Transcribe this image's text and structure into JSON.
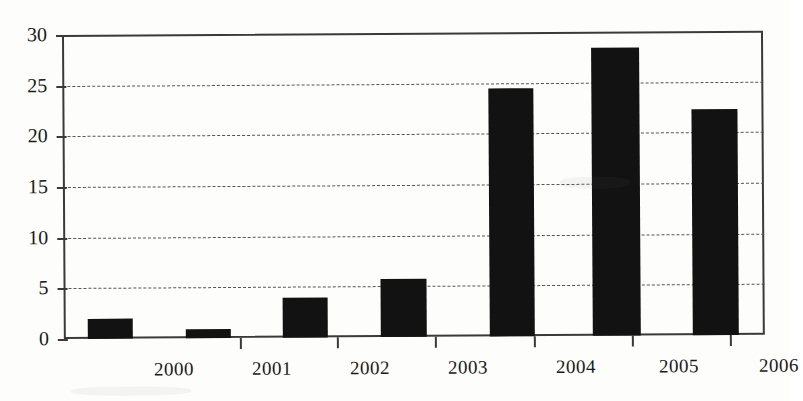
{
  "chart_data": {
    "type": "bar",
    "title": "",
    "subtitle": "",
    "xlabel": "",
    "ylabel": "",
    "categories": [
      "2000",
      "2001",
      "2002",
      "2003",
      "2004",
      "2005",
      "2006"
    ],
    "values": [
      2.0,
      0.9,
      3.9,
      5.7,
      24.5,
      28.4,
      22.3
    ],
    "series": [
      {
        "name": "",
        "values": [
          2.0,
          0.9,
          3.9,
          5.7,
          24.5,
          28.4,
          22.3
        ]
      }
    ],
    "ylim": [
      0,
      30
    ],
    "yticks": [
      0,
      5,
      10,
      15,
      20,
      25,
      30
    ],
    "ytick_labels": [
      "0",
      "5",
      "10",
      "15",
      "20",
      "25",
      "30"
    ],
    "xtick_labels": [
      "2000",
      "2001",
      "2002",
      "2003",
      "2004",
      "2005",
      "2006"
    ],
    "grid": true,
    "grid_axis": "y",
    "grid_style": "dashed",
    "legend": false,
    "legend_position": "none",
    "bar_color": "#121212",
    "axis_color": "#3a3a3a",
    "grid_color": "#555555",
    "background_color": "#fdfdfb"
  },
  "bars": [
    {
      "label": "2000",
      "value": 2.0,
      "left_px": 24,
      "width_px": 45
    },
    {
      "label": "2001",
      "value": 0.9,
      "left_px": 122,
      "width_px": 45
    },
    {
      "label": "2002",
      "value": 3.9,
      "left_px": 219,
      "width_px": 45
    },
    {
      "label": "2003",
      "value": 5.7,
      "left_px": 317,
      "width_px": 46
    },
    {
      "label": "2004",
      "value": 24.5,
      "left_px": 426,
      "width_px": 45
    },
    {
      "label": "2005",
      "value": 28.4,
      "left_px": 529,
      "width_px": 48
    },
    {
      "label": "2006",
      "value": 22.3,
      "left_px": 629,
      "width_px": 46
    }
  ],
  "yaxis": {
    "ticks": [
      {
        "label": "30",
        "value": 30
      },
      {
        "label": "25",
        "value": 25
      },
      {
        "label": "20",
        "value": 20
      },
      {
        "label": "15",
        "value": 15
      },
      {
        "label": "10",
        "value": 10
      },
      {
        "label": "5",
        "value": 5
      },
      {
        "label": "0",
        "value": 0
      }
    ]
  },
  "xaxis": {
    "tick_positions_px": [
      176,
      273,
      371,
      470,
      568,
      666
    ],
    "labels": [
      {
        "text": "2000",
        "center_px": 110
      },
      {
        "text": "2001",
        "center_px": 208
      },
      {
        "text": "2002",
        "center_px": 306
      },
      {
        "text": "2003",
        "center_px": 404
      },
      {
        "text": "2004",
        "center_px": 512
      },
      {
        "text": "2005",
        "center_px": 615
      },
      {
        "text": "2006",
        "center_px": 715
      }
    ]
  }
}
